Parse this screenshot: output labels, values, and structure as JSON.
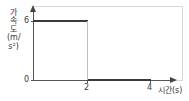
{
  "chart_data": {
    "type": "line",
    "title": "",
    "subtitle": "",
    "xlabel": "시간(s)",
    "ylabel": "가속도(m/s²)",
    "ylabel_vertical": "가속도(m/s²)",
    "xlim": [
      0,
      4.4
    ],
    "ylim": [
      0,
      7
    ],
    "xticks": [
      2,
      4
    ],
    "xtick_labels": [
      "2",
      "4"
    ],
    "yticks": [
      0,
      6
    ],
    "ytick_labels": [
      "0",
      "6"
    ],
    "grid": false,
    "legend": null,
    "annotations": [],
    "series": [
      {
        "name": "가속도",
        "style": "step",
        "color": "#3b3b3b",
        "x": [
          0,
          2,
          2,
          4
        ],
        "values": [
          6,
          6,
          0,
          0
        ],
        "points": [
          {
            "x": 0,
            "y": 6
          },
          {
            "x": 2,
            "y": 6
          },
          {
            "x": 2,
            "y": 0
          },
          {
            "x": 4,
            "y": 0
          }
        ]
      }
    ]
  },
  "axes": {
    "y": {
      "title": "가속도(m/s²)",
      "title_chars": [
        "가",
        "속",
        "도",
        "(",
        "m",
        "/",
        "s",
        "²",
        ")"
      ],
      "tick_high": "6",
      "tick_zero": "0"
    },
    "x": {
      "title": "시간(s)",
      "tick_mid": "2",
      "tick_end": "4"
    }
  },
  "colors": {
    "data_line": "#3b3b3b",
    "axis": "#555555",
    "frame": "#d8d8d8",
    "drop_line": "#bfbfbf",
    "text": "#3a3a3a",
    "background": "#ffffff"
  }
}
